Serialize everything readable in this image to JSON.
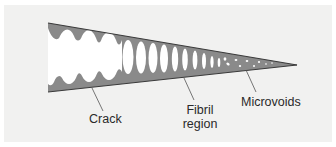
{
  "diagram": {
    "colors": {
      "background": "#f1f1f0",
      "wedge_fill": "#8a8a8a",
      "wedge_edge": "#3a3a3a",
      "void_fill": "#ffffff",
      "leader_line": "#555555",
      "text": "#2a2a2a"
    },
    "labels": {
      "crack": "Crack",
      "fibril_line1": "Fibril",
      "fibril_line2": "region",
      "microvoids": "Microvoids"
    }
  }
}
